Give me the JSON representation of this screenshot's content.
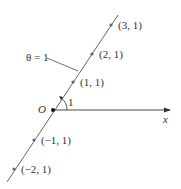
{
  "diagram": {
    "origin_label": "O",
    "axis_label": "x",
    "angle_label": "1",
    "line_label": "θ = 1",
    "points": [
      {
        "label": "(3, 1)",
        "x": 111,
        "y": 25,
        "lx": 118,
        "ly": 29
      },
      {
        "label": "(2, 1)",
        "x": 92,
        "y": 54,
        "lx": 99,
        "ly": 58
      },
      {
        "label": "(1, 1)",
        "x": 73,
        "y": 82,
        "lx": 80,
        "ly": 86
      },
      {
        "label": "(−1, 1)",
        "x": 34,
        "y": 140,
        "lx": 41,
        "ly": 144
      },
      {
        "label": "(−2, 1)",
        "x": 14,
        "y": 169,
        "lx": 21,
        "ly": 173
      }
    ],
    "colors": {
      "line": "#555555",
      "point": "#666666",
      "text": "#333333"
    }
  }
}
